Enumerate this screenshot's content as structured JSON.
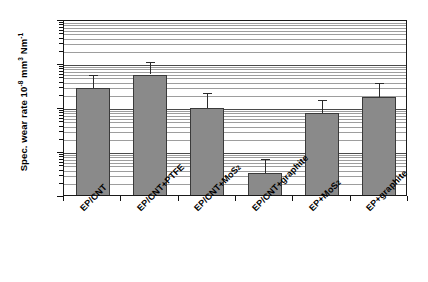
{
  "chart_data": {
    "type": "bar",
    "title": "",
    "xlabel": "",
    "ylabel": "Spec. wear rate 10-8 mm3 Nm-1",
    "ylabel_parts": {
      "prefix": "Spec. wear rate 10",
      "exp1": "-8",
      "mid": " mm",
      "exp2": "3",
      "mid2": " Nm",
      "exp3": "-1"
    },
    "yscale": "log",
    "ylim": [
      1,
      10000
    ],
    "grid": "horizontal-log-minor-and-major",
    "legend": "none",
    "ytick_labels": [
      "10000",
      "1000",
      "100",
      "10",
      "1"
    ],
    "ytick_values": [
      10000,
      1000,
      100,
      10,
      1
    ],
    "categories": [
      "EP/CNT",
      "EP/CNT+PTFE",
      "EP/CNT+MoS2",
      "EP/CNT+graphite",
      "EP+MoS2",
      "EP+graphite"
    ],
    "category_parts": [
      {
        "text": "EP/CNT",
        "sub": "",
        "tail": ""
      },
      {
        "text": "EP/CNT+PTFE",
        "sub": "",
        "tail": ""
      },
      {
        "text": "EP/CNT+MoS",
        "sub": "2",
        "tail": ""
      },
      {
        "text": "EP/CNT+graphite",
        "sub": "",
        "tail": ""
      },
      {
        "text": "EP+MoS",
        "sub": "2",
        "tail": ""
      },
      {
        "text": "EP+graphite",
        "sub": "",
        "tail": ""
      }
    ],
    "values": [
      300,
      600,
      105,
      3.5,
      80,
      190
    ],
    "errors_upper": [
      600,
      1150,
      230,
      7.2,
      160,
      400
    ],
    "bar_color": "#8a8a8a",
    "bar_edge_color": "#3a3a3a",
    "error_color": "#2b2b2b"
  }
}
